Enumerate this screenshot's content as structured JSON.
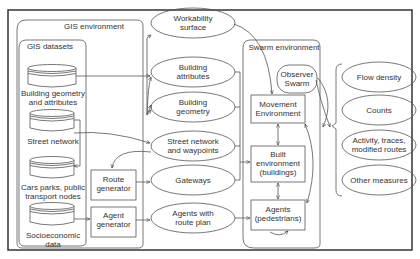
{
  "diagram": {
    "containers": {
      "gis_environment": "GIS environment",
      "gis_datasets": "GIS datasets",
      "swarm_environment": "Swarm environment"
    },
    "datasets": [
      {
        "line1": "Building geometry",
        "line2": "and attributes"
      },
      {
        "line1": "Street network",
        "line2": ""
      },
      {
        "line1": "Cars parks, public",
        "line2": "transport nodes"
      },
      {
        "line1": "Socioeconomic",
        "line2": "data"
      }
    ],
    "generators": [
      {
        "line1": "Route",
        "line2": "generator"
      },
      {
        "line1": "Agent",
        "line2": "generator"
      }
    ],
    "layers": [
      {
        "line1": "Workability",
        "line2": "surface"
      },
      {
        "line1": "Building",
        "line2": "attributes"
      },
      {
        "line1": "Building",
        "line2": "geometry"
      },
      {
        "line1": "Street network",
        "line2": "and waypoints"
      },
      {
        "line1": "Gateways",
        "line2": ""
      },
      {
        "line1": "Agents with",
        "line2": "route plan"
      }
    ],
    "swarm": {
      "observer": {
        "line1": "Observer",
        "line2": "Swarm"
      },
      "movement": {
        "line1": "Movement",
        "line2": "Environment"
      },
      "built": {
        "line1": "Built",
        "line2": "environment",
        "line3": "(buildings)"
      },
      "agents": {
        "line1": "Agents",
        "line2": "(pedestrians)"
      }
    },
    "outputs": [
      {
        "line1": "Flow density",
        "line2": ""
      },
      {
        "line1": "Counts",
        "line2": ""
      },
      {
        "line1": "Activity, traces,",
        "line2": "modified routes"
      },
      {
        "line1": "Other measures",
        "line2": ""
      }
    ],
    "colors": {
      "stroke": "#555555",
      "frame": "#333333",
      "text": "#333333",
      "background": "#ffffff"
    }
  }
}
